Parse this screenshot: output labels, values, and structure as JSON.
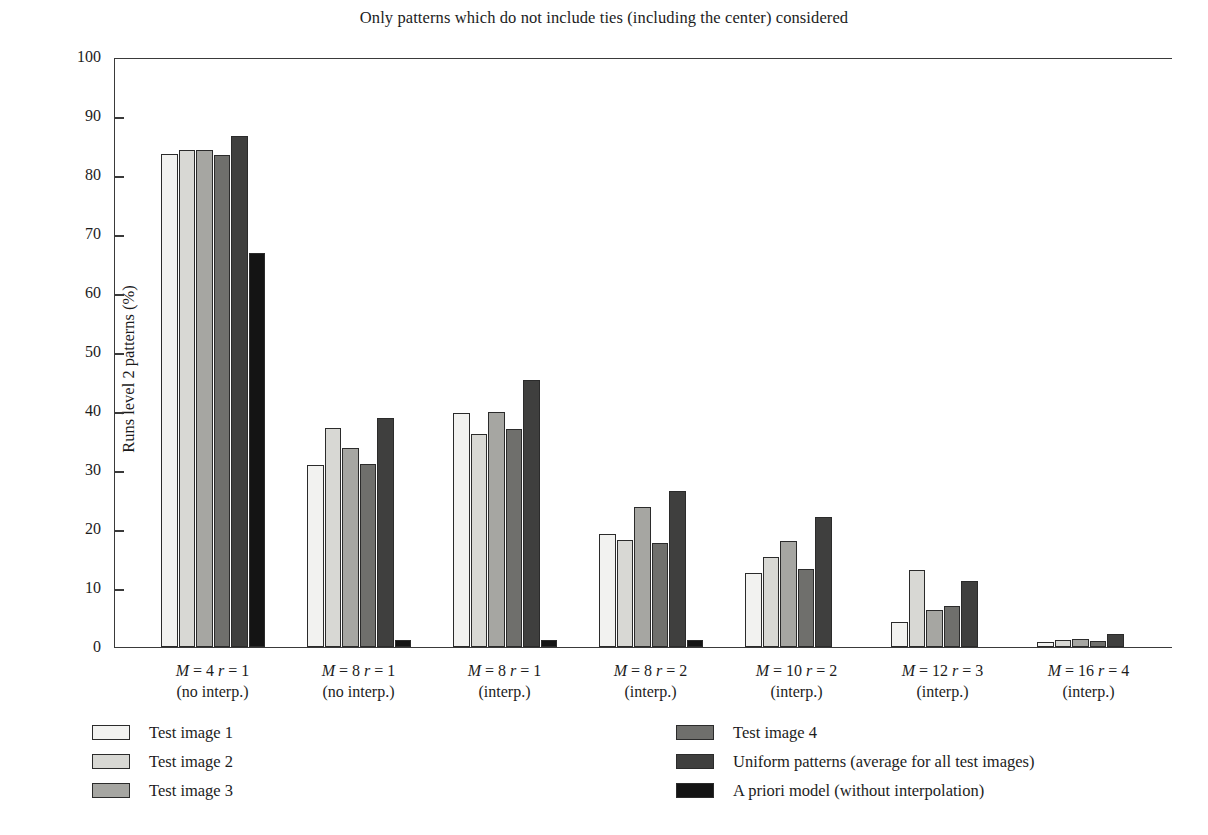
{
  "chart_data": {
    "type": "bar",
    "title": "Only patterns which do not include ties (including the center) considered",
    "xlabel": "",
    "ylabel": "Runs level 2 patterns (%)",
    "ylim": [
      0,
      100
    ],
    "ytick_step": 10,
    "yticks": [
      0,
      10,
      20,
      30,
      40,
      50,
      60,
      70,
      80,
      90,
      100
    ],
    "grid": false,
    "legend_position": "below-plot, two columns",
    "categories": [
      {
        "line1": "M = 4   r = 1",
        "line2": "(no interp.)"
      },
      {
        "line1": "M = 8   r = 1",
        "line2": "(no interp.)"
      },
      {
        "line1": "M = 8   r = 1",
        "line2": "(interp.)"
      },
      {
        "line1": "M = 8   r = 2",
        "line2": "(interp.)"
      },
      {
        "line1": "M = 10  r = 2",
        "line2": "(interp.)"
      },
      {
        "line1": "M = 12  r = 3",
        "line2": "(interp.)"
      },
      {
        "line1": "M = 16  r = 4",
        "line2": "(interp.)"
      }
    ],
    "series": [
      {
        "name": "Test image 1",
        "color": "#f2f2f0",
        "values": [
          83.6,
          30.8,
          39.7,
          19.2,
          12.5,
          4.2,
          0.9
        ]
      },
      {
        "name": "Test image 2",
        "color": "#d8d8d4",
        "values": [
          84.2,
          37.2,
          36.1,
          18.1,
          15.2,
          13.1,
          1.2
        ]
      },
      {
        "name": "Test image 3",
        "color": "#a6a6a2",
        "values": [
          84.3,
          33.8,
          39.8,
          23.7,
          18.0,
          6.2,
          1.4
        ]
      },
      {
        "name": "Test image 4",
        "color": "#6f6f6c",
        "values": [
          83.4,
          31.1,
          37.0,
          17.6,
          13.3,
          6.9,
          1.0
        ]
      },
      {
        "name": "Uniform patterns (average for all test images)",
        "color": "#3f3f3e",
        "values": [
          86.6,
          38.9,
          45.3,
          26.4,
          22.1,
          11.2,
          2.2
        ]
      },
      {
        "name": "A priori model (without interpolation)",
        "color": "#141414",
        "values": [
          66.8,
          1.2,
          1.2,
          1.2,
          0.0,
          0.0,
          0.0
        ]
      }
    ]
  },
  "axis": {
    "tick_labels": [
      "100",
      "90",
      "80",
      "70",
      "60",
      "50",
      "40",
      "30",
      "20",
      "10",
      "0"
    ]
  }
}
